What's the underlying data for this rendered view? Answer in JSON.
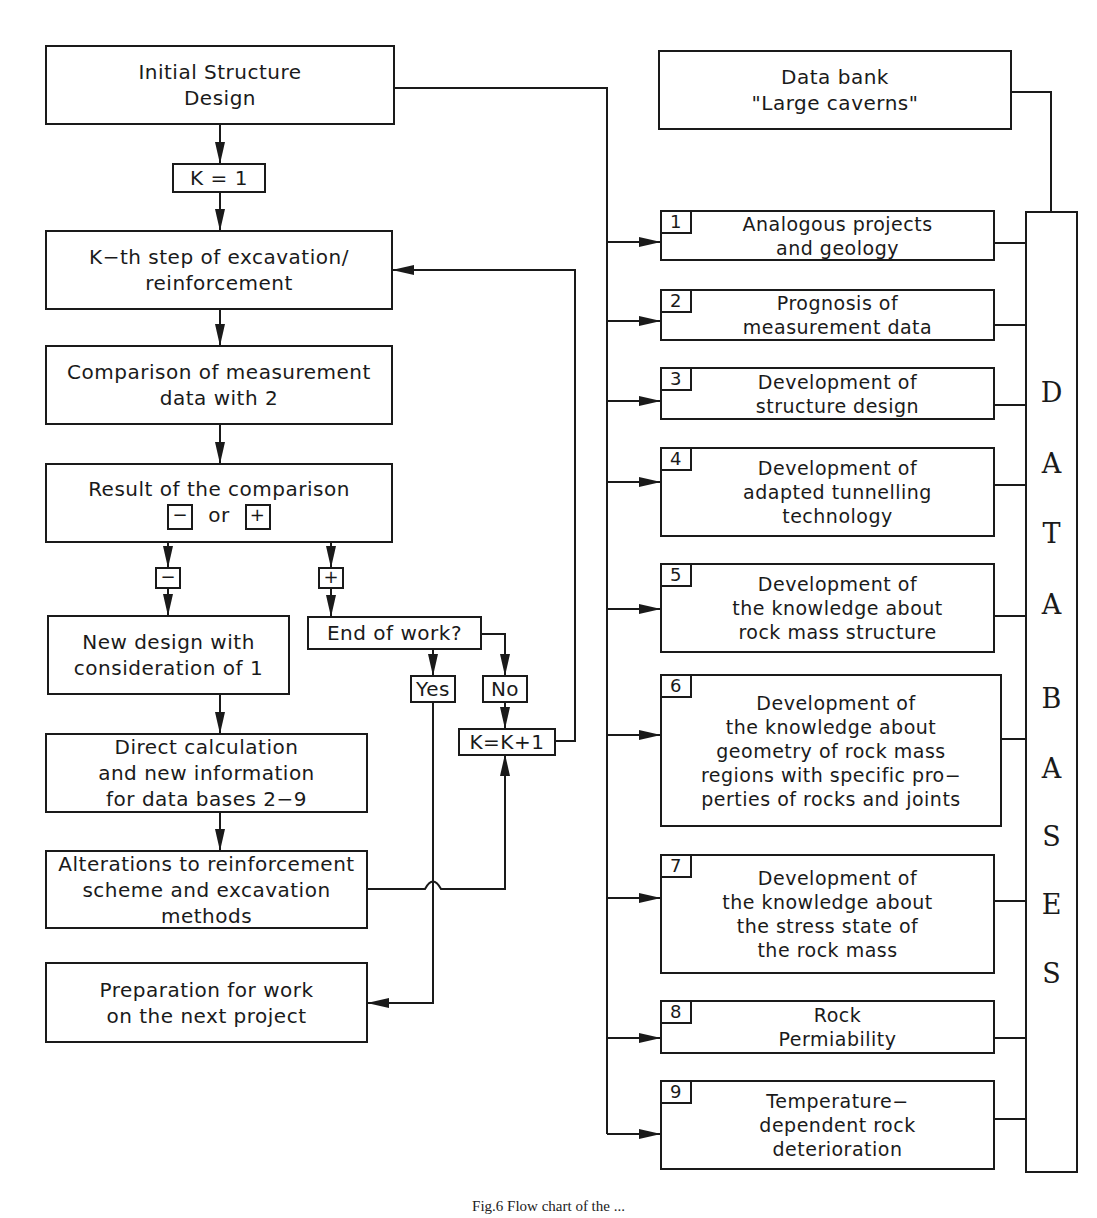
{
  "flowchart": {
    "initial_design": [
      "Initial Structure",
      "Design"
    ],
    "k_init": "K = 1",
    "kth_step": [
      "K−th step of excavation/",
      "reinforcement"
    ],
    "comparison": [
      "Comparison of measurement",
      "data with 2"
    ],
    "result": {
      "line1": "Result of the comparison",
      "minus": "−",
      "or": "or",
      "plus": "+"
    },
    "minus_branch_label": "−",
    "plus_branch_label": "+",
    "new_design": [
      "New design with",
      "consideration of 1"
    ],
    "end_of_work": "End of work?",
    "yes": "Yes",
    "no": "No",
    "k_increment": "K=K+1",
    "direct_calc": [
      "Direct calculation",
      "and new information",
      "for data bases 2−9"
    ],
    "alterations": [
      "Alterations to reinforcement",
      "scheme and excavation",
      "methods"
    ],
    "preparation": [
      "Preparation for work",
      "on the next project"
    ]
  },
  "data_bank": [
    "Data bank",
    "\"Large caverns\""
  ],
  "databases": {
    "column_label": [
      "D",
      "A",
      "T",
      "A",
      "B",
      "A",
      "S",
      "E",
      "S"
    ],
    "items": [
      {
        "num": "1",
        "lines": [
          "Analogous projects",
          "and geology"
        ]
      },
      {
        "num": "2",
        "lines": [
          "Prognosis of",
          "measurement data"
        ]
      },
      {
        "num": "3",
        "lines": [
          "Development of",
          "structure design"
        ]
      },
      {
        "num": "4",
        "lines": [
          "Development of",
          "adapted tunnelling",
          "technology"
        ]
      },
      {
        "num": "5",
        "lines": [
          "Development of",
          "the knowledge about",
          "rock mass structure"
        ]
      },
      {
        "num": "6",
        "lines": [
          "Development of",
          "the knowledge about",
          "geometry of rock mass",
          "regions with specific pro−",
          "perties of rocks and joints"
        ]
      },
      {
        "num": "7",
        "lines": [
          "Development of",
          "the knowledge about",
          "the stress state of",
          "the rock mass"
        ]
      },
      {
        "num": "8",
        "lines": [
          "Rock",
          "Permiability"
        ]
      },
      {
        "num": "9",
        "lines": [
          "Temperature−",
          "dependent rock",
          "deterioration"
        ]
      }
    ]
  },
  "caption": "Fig.6 Flow chart of the ..."
}
